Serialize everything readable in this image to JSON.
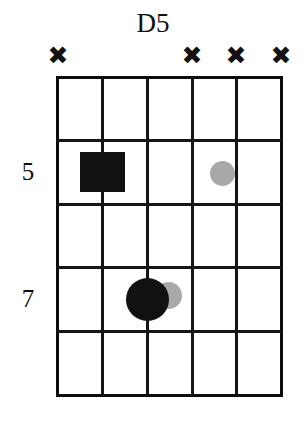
{
  "diagram": {
    "type": "guitar-chord-diagram",
    "chord_name": "D5",
    "strings": 6,
    "frets": 5,
    "colors": {
      "grid": "#151515",
      "root_marker": "#111111",
      "interval_marker": "#a8a8a8",
      "background": "#ffffff"
    },
    "fret_numbers": [
      {
        "label": "5",
        "fret_index": 1
      },
      {
        "label": "7",
        "fret_index": 3
      }
    ],
    "string_markers": [
      {
        "string": 1,
        "symbol": "✖",
        "state": "muted"
      },
      {
        "string": 2,
        "symbol": "",
        "state": "played"
      },
      {
        "string": 3,
        "symbol": "",
        "state": "played"
      },
      {
        "string": 4,
        "symbol": "✖",
        "state": "muted"
      },
      {
        "string": 5,
        "symbol": "✖",
        "state": "muted"
      },
      {
        "string": 6,
        "symbol": "✖",
        "state": "muted"
      }
    ],
    "markers": [
      {
        "id": "root-square",
        "shape": "square",
        "string": 2,
        "fret_index": 1,
        "color": "#111111",
        "size": 45,
        "role": "root"
      },
      {
        "id": "fifth-small-dot",
        "shape": "circle",
        "string": 3,
        "fret_index": 1,
        "color": "#a8a8a8",
        "size": 23,
        "role": "optional"
      },
      {
        "id": "fifth-large-dot",
        "shape": "circle",
        "string": 3,
        "fret_index": 3,
        "color": "#111111",
        "size": 43,
        "role": "fifth"
      },
      {
        "id": "octave-small-dot",
        "shape": "circle",
        "string": 3.45,
        "fret_index": 3,
        "color": "#a8a8a8",
        "size": 25,
        "role": "optional"
      }
    ]
  }
}
